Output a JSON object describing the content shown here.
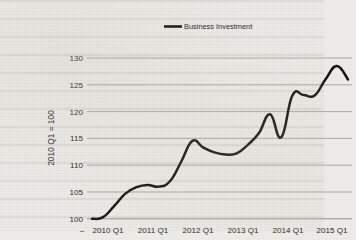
{
  "chart_data": {
    "type": "line",
    "title": "",
    "xlabel": "",
    "ylabel": "2010 Q1 = 100",
    "legend": [
      "Business Investment"
    ],
    "legend_position": "top-center",
    "grid": true,
    "ylim": [
      100,
      130
    ],
    "yticks": [
      100,
      105,
      110,
      115,
      120,
      125,
      130
    ],
    "ytick_labels": [
      "100",
      "105",
      "110",
      "115",
      "120",
      "125",
      "130"
    ],
    "xtick_labels": [
      "2010 Q1",
      "2011 Q1",
      "2012 Q1",
      "2013 Q1",
      "2014 Q1",
      "2015 Q1"
    ],
    "x_axis_leading_mark": "–",
    "x": [
      "2010 Q1",
      "2010 Q2",
      "2010 Q3",
      "2010 Q4",
      "2011 Q1",
      "2011 Q2",
      "2011 Q3",
      "2011 Q4",
      "2012 Q1",
      "2012 Q2",
      "2012 Q3",
      "2012 Q4",
      "2013 Q1",
      "2013 Q2",
      "2013 Q3",
      "2013 Q4",
      "2014 Q1",
      "2014 Q2",
      "2014 Q3",
      "2014 Q4",
      "2015 Q1",
      "2015 Q2",
      "2015 Q3",
      "2015 Q4"
    ],
    "series": [
      {
        "name": "Business Investment",
        "color": "#15130f",
        "values": [
          100.0,
          100.3,
          102.4,
          104.7,
          105.9,
          106.3,
          106.0,
          107.0,
          110.6,
          114.5,
          113.3,
          112.4,
          112.0,
          112.2,
          113.8,
          116.0,
          119.5,
          115.2,
          123.0,
          123.1,
          123.0,
          126.1,
          128.5,
          126.0
        ]
      }
    ]
  }
}
